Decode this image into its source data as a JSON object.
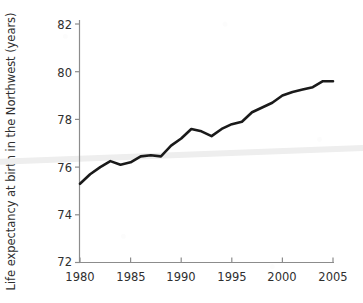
{
  "chart_data": {
    "type": "line",
    "title": "",
    "subtitle": "",
    "xlabel": "",
    "ylabel": "Life expectancy at birth in the Northwest (years)",
    "xlim": [
      1980,
      2005
    ],
    "ylim": [
      72,
      82
    ],
    "xticks": [
      1980,
      1985,
      1990,
      1995,
      2000,
      2005
    ],
    "yticks": [
      72,
      74,
      76,
      78,
      80,
      82
    ],
    "xtick_labels": [
      "1980",
      "1985",
      "1990",
      "1995",
      "2000",
      "2005"
    ],
    "ytick_labels": [
      "72",
      "74",
      "76",
      "78",
      "80",
      "82"
    ],
    "grid": false,
    "legend": "none",
    "series": [
      {
        "name": "Life expectancy at birth in the Northwest",
        "color": "#1a1a1a",
        "line_width": 2.6,
        "x": [
          1980,
          1981,
          1982,
          1983,
          1984,
          1985,
          1986,
          1987,
          1988,
          1989,
          1990,
          1991,
          1992,
          1993,
          1994,
          1995,
          1996,
          1997,
          1998,
          1999,
          2000,
          2001,
          2002,
          2003,
          2004,
          2005
        ],
        "values": [
          75.3,
          75.7,
          76.0,
          76.25,
          76.1,
          76.2,
          76.45,
          76.5,
          76.45,
          76.9,
          77.2,
          77.6,
          77.5,
          77.3,
          77.6,
          77.8,
          77.9,
          78.3,
          78.5,
          78.7,
          79.0,
          79.15,
          79.25,
          79.35,
          79.6,
          79.6
        ]
      },
      {
        "name": "reference-band",
        "color": "#eeeeee",
        "line_width": 6,
        "x": [
          1980,
          2005
        ],
        "values": [
          76.35,
          76.75
        ]
      }
    ]
  },
  "axis": {
    "spine_color": "#8c8c8c",
    "tick_color": "#8c8c8c",
    "text_color": "#2f2f2f"
  }
}
